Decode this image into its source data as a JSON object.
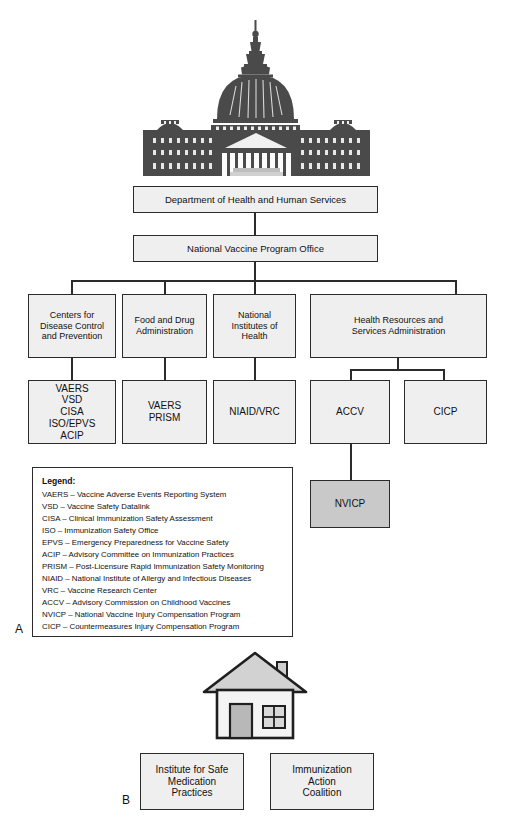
{
  "figure": {
    "panel_a_label": "A",
    "panel_b_label": "B"
  },
  "icons": {
    "capitol": "us-capitol-building-icon",
    "house": "house-icon"
  },
  "colors": {
    "box_fill": "#efefef",
    "box_fill_highlight": "#c9c9c9",
    "box_border": "#2b2b2b",
    "connector": "#2b2b2b",
    "page_background": "#ffffff",
    "text": "#111111"
  },
  "hierarchy": {
    "tier1": {
      "label": "Department of Health and Human Services"
    },
    "tier2": {
      "label": "National Vaccine Program Office"
    },
    "tier3": [
      {
        "id": "cdc",
        "label": "Centers for\nDisease Control\nand Prevention"
      },
      {
        "id": "fda",
        "label": "Food and Drug\nAdministration"
      },
      {
        "id": "nih",
        "label": "National\nInstitutes of\nHealth"
      },
      {
        "id": "hrsa",
        "label": "Health Resources and\nServices Administration"
      }
    ],
    "tier4": [
      {
        "id": "cdc-programs",
        "label": "VAERS\nVSD\nCISA\nISO/EPVS\nACIP",
        "parent": "cdc",
        "highlight": false
      },
      {
        "id": "fda-programs",
        "label": "VAERS\nPRISM",
        "parent": "fda",
        "highlight": false
      },
      {
        "id": "nih-programs",
        "label": "NIAID/VRC",
        "parent": "nih",
        "highlight": false
      },
      {
        "id": "accv",
        "label": "ACCV",
        "parent": "hrsa",
        "highlight": false
      },
      {
        "id": "cicp",
        "label": "CICP",
        "parent": "hrsa",
        "highlight": false
      }
    ],
    "tier5": [
      {
        "id": "nvicp",
        "label": "NVICP",
        "parent": "accv",
        "highlight": true
      }
    ]
  },
  "legend": {
    "title": "Legend:",
    "entries": [
      "VAERS – Vaccine Adverse Events Reporting System",
      "VSD – Vaccine Safety Datalink",
      "CISA – Clinical Immunization Safety Assessment",
      "ISO – Immunization Safety Office",
      "EPVS – Emergency Preparedness for Vaccine Safety",
      "ACIP – Advisory Committee on Immunization Practices",
      "PRISM – Post-Licensure Rapid Immunization Safety Monitoring",
      "NIAID – National Institute of Allergy and Infectious Diseases",
      "VRC – Vaccine Research Center",
      "ACCV – Advisory Commission on Childhood Vaccines",
      "NVICP – National Vaccine Injury Compensation Program",
      "CICP – Countermeasures Injury Compensation Program"
    ]
  },
  "panel_b": {
    "organizations": [
      {
        "id": "ismp",
        "label": "Institute for Safe\nMedication\nPractices"
      },
      {
        "id": "iac",
        "label": "Immunization\nAction\nCoalition"
      }
    ]
  }
}
